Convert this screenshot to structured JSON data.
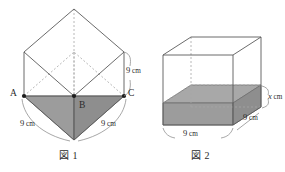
{
  "figures": [
    {
      "caption": "図 1",
      "vertex_labels": [
        {
          "name": "A",
          "text": "A"
        },
        {
          "name": "B",
          "text": "B"
        },
        {
          "name": "C",
          "text": "C"
        }
      ],
      "dimensions": [
        {
          "name": "edge-right-vertical",
          "value": "9",
          "unit": "cm"
        },
        {
          "name": "edge-ab",
          "value": "9",
          "unit": "cm"
        },
        {
          "name": "edge-bc",
          "value": "9",
          "unit": "cm"
        }
      ],
      "shape": "cube-rotated-with-shaded-triangle",
      "shaded_fill": "#a9a9a9"
    },
    {
      "caption": "図 2",
      "dimensions": [
        {
          "name": "height-x",
          "value": "x",
          "unit": "cm",
          "italic": true
        },
        {
          "name": "depth",
          "value": "9",
          "unit": "cm",
          "italic": false
        },
        {
          "name": "width",
          "value": "9",
          "unit": "cm",
          "italic": false
        }
      ],
      "shape": "cube-with-shaded-water-slab",
      "shaded_fill": "#a9a9a9"
    }
  ],
  "colors": {
    "line": "#555555",
    "line_dashed": "#9a9a9a",
    "shade_top": "#a8a8a8",
    "shade_front": "#9c9c9c",
    "shade_side": "#8e8e8e",
    "text": "#2b2b2b",
    "background": "#ffffff"
  }
}
